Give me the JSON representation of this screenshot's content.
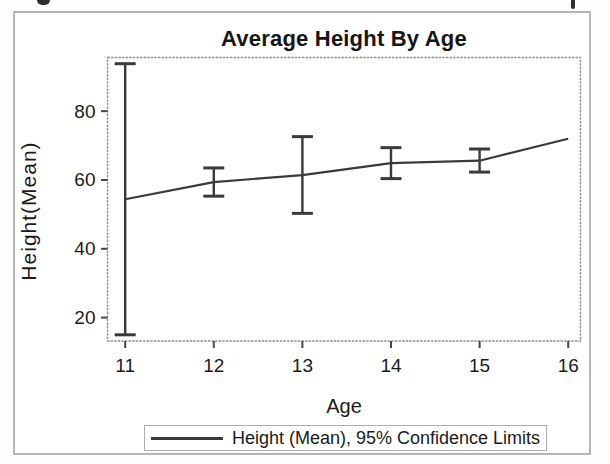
{
  "page": {
    "top_edge_note": "cropped caption text fragments visible at top edge"
  },
  "chart_data": {
    "type": "line",
    "title": "Average Height By Age",
    "xlabel": "Age",
    "ylabel": "Height(Mean)",
    "legend": {
      "position": "bottom",
      "entries": [
        "Height (Mean), 95% Confidence Limits"
      ]
    },
    "x": [
      11,
      12,
      13,
      14,
      15,
      16
    ],
    "series": [
      {
        "name": "Height (Mean)",
        "values": [
          54.4,
          59.4,
          61.4,
          64.9,
          65.6,
          72.0
        ]
      }
    ],
    "error_bars": {
      "label": "95% Confidence Limits",
      "low": [
        15.0,
        55.3,
        50.3,
        60.4,
        62.3,
        null
      ],
      "high": [
        93.8,
        63.5,
        72.6,
        69.4,
        69.0,
        null
      ]
    },
    "xticks": [
      11,
      12,
      13,
      14,
      15,
      16
    ],
    "yticks": [
      20,
      40,
      60,
      80
    ],
    "ylim": [
      13.2,
      95.6
    ],
    "grid": false
  },
  "colors": {
    "text": "#1b1b1b",
    "series_line": "#3a3a3a",
    "frame": "#8e8e8e",
    "tick": "#474747",
    "figure_border": "#b5b5b5",
    "legend_border": "#aeaeae"
  }
}
